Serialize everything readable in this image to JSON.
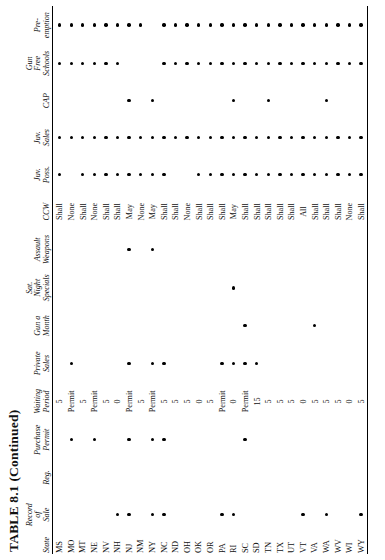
{
  "title": "TABLE 8.1 (Continued)",
  "columns": [
    {
      "key": "state",
      "label_lines": [
        "State"
      ],
      "type": "text",
      "name": "col-state"
    },
    {
      "key": "record_of_sale",
      "label_lines": [
        "Record",
        "of",
        "Sale"
      ],
      "type": "dot",
      "name": "col-record-of-sale"
    },
    {
      "key": "reg",
      "label_lines": [
        "Reg."
      ],
      "type": "dot",
      "name": "col-reg"
    },
    {
      "key": "purchase_permit",
      "label_lines": [
        "Purchase",
        "Permit"
      ],
      "type": "dot",
      "name": "col-purchase-permit"
    },
    {
      "key": "waiting_period",
      "label_lines": [
        "Waiting",
        "Period"
      ],
      "type": "text",
      "name": "col-waiting-period"
    },
    {
      "key": "private_sales",
      "label_lines": [
        "Private",
        "Sales"
      ],
      "type": "dot",
      "name": "col-private-sales"
    },
    {
      "key": "gun_a_month",
      "label_lines": [
        "Gun a",
        "Month"
      ],
      "type": "dot",
      "name": "col-gun-a-month"
    },
    {
      "key": "sat_night_specials",
      "label_lines": [
        "Sat.",
        "Night",
        "Specials"
      ],
      "type": "dot",
      "name": "col-sat-night-specials"
    },
    {
      "key": "assault_weapons",
      "label_lines": [
        "Assault",
        "Weapons"
      ],
      "type": "dot",
      "name": "col-assault-weapons"
    },
    {
      "key": "ccw",
      "label_lines": [
        "CCW"
      ],
      "type": "text",
      "name": "col-ccw"
    },
    {
      "key": "juv_poss",
      "label_lines": [
        "Juv.",
        "Poss."
      ],
      "type": "dot",
      "name": "col-juv-poss"
    },
    {
      "key": "juv_sales",
      "label_lines": [
        "Juv.",
        "Sales"
      ],
      "type": "dot",
      "name": "col-juv-sales"
    },
    {
      "key": "cap",
      "label_lines": [
        "CAP"
      ],
      "type": "dot",
      "name": "col-cap"
    },
    {
      "key": "gun_free_schools",
      "label_lines": [
        "Gun",
        "Free",
        "Schools"
      ],
      "type": "dot",
      "name": "col-gun-free-schools"
    },
    {
      "key": "preemption",
      "label_lines": [
        "Pre-",
        "emption"
      ],
      "type": "dot",
      "name": "col-preemption"
    }
  ],
  "rows": [
    {
      "state": "MS",
      "record_of_sale": false,
      "reg": false,
      "purchase_permit": false,
      "waiting_period": "5",
      "private_sales": false,
      "gun_a_month": false,
      "sat_night_specials": false,
      "assault_weapons": false,
      "ccw": "Shall",
      "juv_poss": true,
      "juv_sales": true,
      "cap": false,
      "gun_free_schools": true,
      "preemption": true
    },
    {
      "state": "MO",
      "record_of_sale": false,
      "reg": false,
      "purchase_permit": true,
      "waiting_period": "Permit",
      "private_sales": true,
      "gun_a_month": false,
      "sat_night_specials": false,
      "assault_weapons": false,
      "ccw": "None",
      "juv_poss": false,
      "juv_sales": true,
      "cap": false,
      "gun_free_schools": true,
      "preemption": true
    },
    {
      "state": "MT",
      "record_of_sale": false,
      "reg": false,
      "purchase_permit": false,
      "waiting_period": "5",
      "private_sales": false,
      "gun_a_month": false,
      "sat_night_specials": false,
      "assault_weapons": false,
      "ccw": "Shall",
      "juv_poss": true,
      "juv_sales": true,
      "cap": false,
      "gun_free_schools": true,
      "preemption": true
    },
    {
      "state": "NE",
      "record_of_sale": false,
      "reg": false,
      "purchase_permit": true,
      "waiting_period": "Permit",
      "private_sales": false,
      "gun_a_month": false,
      "sat_night_specials": false,
      "assault_weapons": false,
      "ccw": "None",
      "juv_poss": true,
      "juv_sales": true,
      "cap": false,
      "gun_free_schools": true,
      "preemption": true
    },
    {
      "state": "NV",
      "record_of_sale": false,
      "reg": false,
      "purchase_permit": false,
      "waiting_period": "5",
      "private_sales": false,
      "gun_a_month": false,
      "sat_night_specials": false,
      "assault_weapons": false,
      "ccw": "Shall",
      "juv_poss": true,
      "juv_sales": true,
      "cap": false,
      "gun_free_schools": true,
      "preemption": true
    },
    {
      "state": "NH",
      "record_of_sale": true,
      "reg": false,
      "purchase_permit": false,
      "waiting_period": "0",
      "private_sales": false,
      "gun_a_month": false,
      "sat_night_specials": false,
      "assault_weapons": false,
      "ccw": "Shall",
      "juv_poss": true,
      "juv_sales": true,
      "cap": false,
      "gun_free_schools": true,
      "preemption": true
    },
    {
      "state": "NJ",
      "record_of_sale": true,
      "reg": false,
      "purchase_permit": true,
      "waiting_period": "Permit",
      "private_sales": true,
      "gun_a_month": false,
      "sat_night_specials": false,
      "assault_weapons": true,
      "ccw": "May",
      "juv_poss": true,
      "juv_sales": true,
      "cap": true,
      "gun_free_schools": false,
      "preemption": true
    },
    {
      "state": "NM",
      "record_of_sale": false,
      "reg": false,
      "purchase_permit": false,
      "waiting_period": "5",
      "private_sales": false,
      "gun_a_month": false,
      "sat_night_specials": false,
      "assault_weapons": false,
      "ccw": "None",
      "juv_poss": true,
      "juv_sales": true,
      "cap": false,
      "gun_free_schools": false,
      "preemption": true
    },
    {
      "state": "NY",
      "record_of_sale": true,
      "reg": false,
      "purchase_permit": true,
      "waiting_period": "Permit",
      "private_sales": true,
      "gun_a_month": false,
      "sat_night_specials": false,
      "assault_weapons": true,
      "ccw": "May",
      "juv_poss": true,
      "juv_sales": true,
      "cap": true,
      "gun_free_schools": false,
      "preemption": false
    },
    {
      "state": "NC",
      "record_of_sale": true,
      "reg": false,
      "purchase_permit": true,
      "waiting_period": "5",
      "private_sales": true,
      "gun_a_month": false,
      "sat_night_specials": false,
      "assault_weapons": false,
      "ccw": "Shall",
      "juv_poss": true,
      "juv_sales": true,
      "cap": false,
      "gun_free_schools": true,
      "preemption": true
    },
    {
      "state": "ND",
      "record_of_sale": false,
      "reg": false,
      "purchase_permit": false,
      "waiting_period": "5",
      "private_sales": false,
      "gun_a_month": false,
      "sat_night_specials": false,
      "assault_weapons": false,
      "ccw": "Shall",
      "juv_poss": false,
      "juv_sales": true,
      "cap": false,
      "gun_free_schools": true,
      "preemption": true
    },
    {
      "state": "OH",
      "record_of_sale": false,
      "reg": false,
      "purchase_permit": false,
      "waiting_period": "5",
      "private_sales": false,
      "gun_a_month": false,
      "sat_night_specials": false,
      "assault_weapons": false,
      "ccw": "None",
      "juv_poss": false,
      "juv_sales": true,
      "cap": false,
      "gun_free_schools": true,
      "preemption": true
    },
    {
      "state": "OK",
      "record_of_sale": false,
      "reg": false,
      "purchase_permit": false,
      "waiting_period": "0",
      "private_sales": false,
      "gun_a_month": false,
      "sat_night_specials": false,
      "assault_weapons": false,
      "ccw": "Shall",
      "juv_poss": true,
      "juv_sales": true,
      "cap": false,
      "gun_free_schools": true,
      "preemption": true
    },
    {
      "state": "OR",
      "record_of_sale": false,
      "reg": false,
      "purchase_permit": false,
      "waiting_period": "5",
      "private_sales": false,
      "gun_a_month": false,
      "sat_night_specials": false,
      "assault_weapons": false,
      "ccw": "Shall",
      "juv_poss": true,
      "juv_sales": true,
      "cap": false,
      "gun_free_schools": true,
      "preemption": true
    },
    {
      "state": "PA",
      "record_of_sale": true,
      "reg": false,
      "purchase_permit": false,
      "waiting_period": "Permit",
      "private_sales": true,
      "gun_a_month": false,
      "sat_night_specials": false,
      "assault_weapons": false,
      "ccw": "Shall",
      "juv_poss": true,
      "juv_sales": true,
      "cap": false,
      "gun_free_schools": true,
      "preemption": true
    },
    {
      "state": "RI",
      "record_of_sale": true,
      "reg": false,
      "purchase_permit": false,
      "waiting_period": "0",
      "private_sales": true,
      "gun_a_month": false,
      "sat_night_specials": true,
      "assault_weapons": false,
      "ccw": "May",
      "juv_poss": true,
      "juv_sales": true,
      "cap": true,
      "gun_free_schools": true,
      "preemption": true
    },
    {
      "state": "SC",
      "record_of_sale": false,
      "reg": false,
      "purchase_permit": true,
      "waiting_period": "Permit",
      "private_sales": true,
      "gun_a_month": true,
      "sat_night_specials": false,
      "assault_weapons": false,
      "ccw": "Shall",
      "juv_poss": true,
      "juv_sales": true,
      "cap": false,
      "gun_free_schools": true,
      "preemption": true
    },
    {
      "state": "SD",
      "record_of_sale": false,
      "reg": false,
      "purchase_permit": false,
      "waiting_period": "15",
      "private_sales": true,
      "gun_a_month": false,
      "sat_night_specials": false,
      "assault_weapons": false,
      "ccw": "Shall",
      "juv_poss": true,
      "juv_sales": true,
      "cap": false,
      "gun_free_schools": true,
      "preemption": true
    },
    {
      "state": "TN",
      "record_of_sale": false,
      "reg": false,
      "purchase_permit": false,
      "waiting_period": "5",
      "private_sales": false,
      "gun_a_month": false,
      "sat_night_specials": false,
      "assault_weapons": false,
      "ccw": "Shall",
      "juv_poss": true,
      "juv_sales": true,
      "cap": true,
      "gun_free_schools": true,
      "preemption": true
    },
    {
      "state": "TX",
      "record_of_sale": false,
      "reg": false,
      "purchase_permit": false,
      "waiting_period": "5",
      "private_sales": false,
      "gun_a_month": false,
      "sat_night_specials": false,
      "assault_weapons": false,
      "ccw": "Shall",
      "juv_poss": true,
      "juv_sales": true,
      "cap": false,
      "gun_free_schools": true,
      "preemption": true
    },
    {
      "state": "UT",
      "record_of_sale": false,
      "reg": false,
      "purchase_permit": false,
      "waiting_period": "5",
      "private_sales": false,
      "gun_a_month": false,
      "sat_night_specials": false,
      "assault_weapons": false,
      "ccw": "Shall",
      "juv_poss": true,
      "juv_sales": true,
      "cap": false,
      "gun_free_schools": true,
      "preemption": true
    },
    {
      "state": "VT",
      "record_of_sale": true,
      "reg": false,
      "purchase_permit": false,
      "waiting_period": "0",
      "private_sales": false,
      "gun_a_month": false,
      "sat_night_specials": false,
      "assault_weapons": false,
      "ccw": "All",
      "juv_poss": true,
      "juv_sales": true,
      "cap": false,
      "gun_free_schools": true,
      "preemption": true
    },
    {
      "state": "VA",
      "record_of_sale": false,
      "reg": false,
      "purchase_permit": false,
      "waiting_period": "5",
      "private_sales": false,
      "gun_a_month": true,
      "sat_night_specials": false,
      "assault_weapons": false,
      "ccw": "Shall",
      "juv_poss": true,
      "juv_sales": true,
      "cap": false,
      "gun_free_schools": true,
      "preemption": true
    },
    {
      "state": "WA",
      "record_of_sale": true,
      "reg": false,
      "purchase_permit": false,
      "waiting_period": "5",
      "private_sales": false,
      "gun_a_month": false,
      "sat_night_specials": false,
      "assault_weapons": false,
      "ccw": "Shall",
      "juv_poss": true,
      "juv_sales": true,
      "cap": true,
      "gun_free_schools": true,
      "preemption": true
    },
    {
      "state": "WV",
      "record_of_sale": false,
      "reg": false,
      "purchase_permit": false,
      "waiting_period": "5",
      "private_sales": false,
      "gun_a_month": false,
      "sat_night_specials": false,
      "assault_weapons": false,
      "ccw": "Shall",
      "juv_poss": true,
      "juv_sales": true,
      "cap": false,
      "gun_free_schools": true,
      "preemption": true
    },
    {
      "state": "WI",
      "record_of_sale": false,
      "reg": false,
      "purchase_permit": false,
      "waiting_period": "0",
      "private_sales": false,
      "gun_a_month": false,
      "sat_night_specials": false,
      "assault_weapons": false,
      "ccw": "None",
      "juv_poss": true,
      "juv_sales": true,
      "cap": false,
      "gun_free_schools": true,
      "preemption": true
    },
    {
      "state": "WY",
      "record_of_sale": true,
      "reg": false,
      "purchase_permit": false,
      "waiting_period": "5",
      "private_sales": false,
      "gun_a_month": false,
      "sat_night_specials": false,
      "assault_weapons": false,
      "ccw": "Shall",
      "juv_poss": true,
      "juv_sales": true,
      "cap": false,
      "gun_free_schools": true,
      "preemption": true
    }
  ]
}
